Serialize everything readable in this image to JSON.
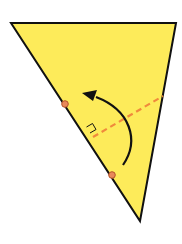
{
  "diagram": {
    "colors": {
      "fill": "#FDEB5A",
      "outline": "#111111",
      "fold_line": "#F08A3C",
      "points": "#E8895A",
      "point_stroke": "#B5552A",
      "arrow": "#111111",
      "right_angle": "#111111"
    },
    "triangle": {
      "vertices": [
        [
          11,
          23
        ],
        [
          176,
          23
        ],
        [
          140,
          221
        ]
      ]
    },
    "points": [
      {
        "name": "upper-point",
        "x": 65,
        "y": 104
      },
      {
        "name": "lower-point",
        "x": 112,
        "y": 175
      }
    ],
    "fold_line": {
      "x1": 93,
      "y1": 137,
      "x2": 163,
      "y2": 96
    },
    "right_angle_marker": true,
    "rotation_arrow": {
      "direction": "counterclockwise"
    }
  }
}
